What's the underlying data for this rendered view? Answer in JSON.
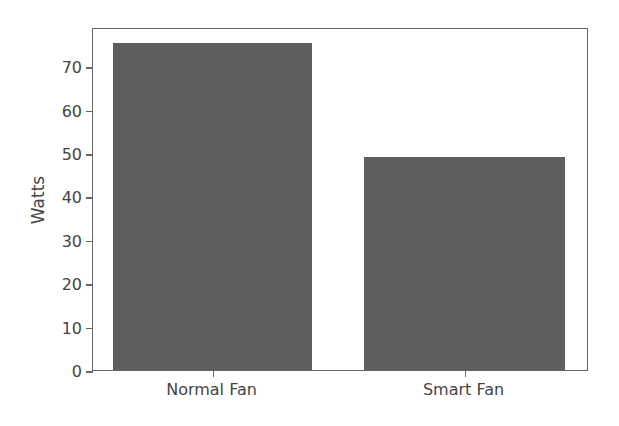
{
  "chart_data": {
    "type": "bar",
    "title": "",
    "xlabel": "",
    "ylabel": "Watts",
    "categories": [
      "Normal Fan",
      "Smart Fan"
    ],
    "values": [
      75.3,
      49.0
    ],
    "ylim": [
      0,
      79
    ],
    "yticks": [
      0,
      10,
      20,
      30,
      40,
      50,
      60,
      70
    ],
    "grid": false,
    "legend": null,
    "bar_color": "#5e5e5e"
  }
}
